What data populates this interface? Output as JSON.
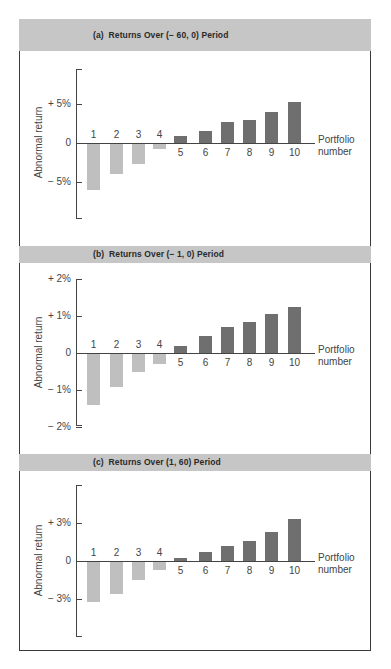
{
  "figure": {
    "colors": {
      "band": "#c6c6c6",
      "negative_bar": "#bfbfbf",
      "positive_bar": "#6f6f6f",
      "frame": "#3a3a3a"
    }
  },
  "chart_data": [
    {
      "type": "bar",
      "title": "(a)  Returns Over (− 60, 0) Period",
      "xlabel": "Portfolio number",
      "ylabel": "Abnormal return",
      "categories": [
        "1",
        "2",
        "3",
        "4",
        "5",
        "6",
        "7",
        "8",
        "9",
        "10"
      ],
      "values": [
        -5.9,
        -3.9,
        -2.6,
        -0.6,
        0.9,
        1.6,
        2.7,
        3.0,
        4.0,
        5.2
      ],
      "unit": "%",
      "yticks": [
        {
          "value": 5,
          "label": "+ 5%"
        },
        {
          "value": 0,
          "label": "0"
        },
        {
          "value": -5,
          "label": "− 5%"
        }
      ],
      "ylim": [
        -9.5,
        9.5
      ],
      "grid": false,
      "legend": "none"
    },
    {
      "type": "bar",
      "title": "(b)  Returns Over (− 1, 0) Period",
      "xlabel": "Portfolio number",
      "ylabel": "Abnormal return",
      "categories": [
        "1",
        "2",
        "3",
        "4",
        "5",
        "6",
        "7",
        "8",
        "9",
        "10"
      ],
      "values": [
        -1.38,
        -0.9,
        -0.5,
        -0.27,
        0.18,
        0.45,
        0.7,
        0.83,
        1.05,
        1.25
      ],
      "unit": "%",
      "yticks": [
        {
          "value": 2,
          "label": "+ 2%"
        },
        {
          "value": 1,
          "label": "+ 1%"
        },
        {
          "value": 0,
          "label": "0"
        },
        {
          "value": -1,
          "label": "− 1%"
        },
        {
          "value": -2,
          "label": "− 2%"
        }
      ],
      "ylim": [
        -2,
        2
      ],
      "grid": false,
      "legend": "none"
    },
    {
      "type": "bar",
      "title": "(c)  Returns Over (1, 60) Period",
      "xlabel": "Portfolio number",
      "ylabel": "Abnormal return",
      "categories": [
        "1",
        "2",
        "3",
        "4",
        "5",
        "6",
        "7",
        "8",
        "9",
        "10"
      ],
      "values": [
        -3.2,
        -2.5,
        -1.45,
        -0.65,
        0.25,
        0.7,
        1.2,
        1.6,
        2.3,
        3.3
      ],
      "unit": "%",
      "yticks": [
        {
          "value": 3,
          "label": "+ 3%"
        },
        {
          "value": 0,
          "label": "0"
        },
        {
          "value": -3,
          "label": "− 3%"
        }
      ],
      "ylim": [
        -6,
        6
      ],
      "grid": false,
      "legend": "none"
    }
  ],
  "labels": {
    "xlabel_line1": "Portfolio",
    "xlabel_line2": "number",
    "ylabel": "Abnormal return"
  }
}
